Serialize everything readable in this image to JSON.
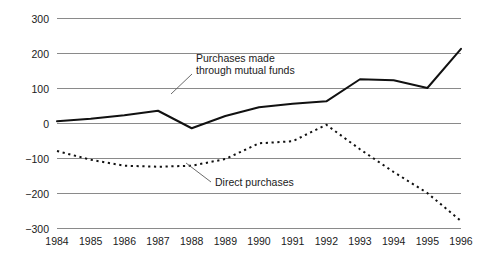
{
  "chart_data": {
    "type": "line",
    "title": "",
    "subtitle": "",
    "xlabel": "",
    "ylabel": "",
    "categories": [
      "1984",
      "1985",
      "1986",
      "1987",
      "1988",
      "1989",
      "1990",
      "1991",
      "1992",
      "1993",
      "1994",
      "1995",
      "1996"
    ],
    "x": [
      1984,
      1985,
      1986,
      1987,
      1988,
      1989,
      1990,
      1991,
      1992,
      1993,
      1994,
      1995,
      1996
    ],
    "xlim": [
      1984,
      1996
    ],
    "ylim": [
      -300,
      300
    ],
    "yticks": [
      300,
      200,
      100,
      0,
      -100,
      -200,
      -300
    ],
    "ytick_labels": [
      "300",
      "200",
      "100",
      "0",
      "−100",
      "−200",
      "−300"
    ],
    "xtick_labels": [
      "1984",
      "1985",
      "1986",
      "1987",
      "1988",
      "1989",
      "1990",
      "1991",
      "1992",
      "1993",
      "1994",
      "1995",
      "1996"
    ],
    "grid": true,
    "grid_axis": "y",
    "legend": "none",
    "series": [
      {
        "name": "Purchases made through mutual funds",
        "style": "solid",
        "color": "#111111",
        "values": [
          5,
          12,
          22,
          35,
          -15,
          20,
          45,
          55,
          62,
          125,
          122,
          100,
          212
        ]
      },
      {
        "name": "Direct purchases",
        "style": "dotted",
        "color": "#111111",
        "values": [
          -80,
          -105,
          -122,
          -125,
          -122,
          -103,
          -58,
          -52,
          -5,
          -75,
          -140,
          -200,
          -280
        ]
      }
    ],
    "annotations": [
      {
        "name": "mutual-funds-label",
        "line1": "Purchases made",
        "line2": "through mutual funds",
        "text_x": 196,
        "text_y": 62,
        "leader": [
          [
            192,
            74
          ],
          [
            171,
            94
          ]
        ]
      },
      {
        "name": "direct-purchases-label",
        "line1": "Direct purchases",
        "line2": "",
        "text_x": 215,
        "text_y": 186,
        "leader": [
          [
            211,
            182
          ],
          [
            186,
            163
          ]
        ]
      }
    ]
  },
  "axis": {
    "y_labels": [
      "300",
      "200",
      "100",
      "0",
      "−100",
      "−200",
      "−300"
    ],
    "x_labels": [
      "1984",
      "1985",
      "1986",
      "1987",
      "1988",
      "1989",
      "1990",
      "1991",
      "1992",
      "1993",
      "1994",
      "1995",
      "1996"
    ]
  }
}
